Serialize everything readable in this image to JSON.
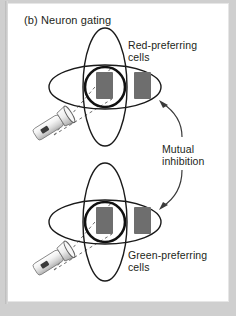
{
  "figure": {
    "panel_label": "(b) Neuron gating",
    "annotations": {
      "red_cells": "Red-preferring\ncells",
      "green_cells": "Green-preferring\ncells",
      "mutual_inhibition": "Mutual\ninhibition"
    },
    "colors": {
      "background": "#ffffff",
      "surround": "#cfcfcf",
      "stroke": "#1a1a1a",
      "neuron_fill": "#6e6e6e",
      "flashlight_body": "#e9e9e9",
      "text": "#231f20"
    },
    "elements": {
      "receptive_field_vertical_ellipse": "vertical-ellipse",
      "receptive_field_horizontal_ellipse": "horizontal-ellipse",
      "gated_neuron_circle": "thick-circle",
      "neuron_left": "gray-rectangle",
      "neuron_right": "gray-rectangle",
      "light_source": "flashlight",
      "light_beam": "dashed-rays",
      "inhibition_arrow_upper": "curved-arrow",
      "inhibition_arrow_lower": "curved-arrow"
    },
    "groups": [
      {
        "name": "red-preferring-group",
        "cy": 87
      },
      {
        "name": "green-preferring-group",
        "cy": 222
      }
    ]
  }
}
